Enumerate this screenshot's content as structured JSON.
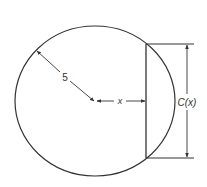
{
  "diagram": {
    "radius_label": "5",
    "distance_label": "x",
    "chord_label": "C(x)",
    "colors": {
      "stroke": "#333333",
      "background": "#ffffff"
    }
  }
}
